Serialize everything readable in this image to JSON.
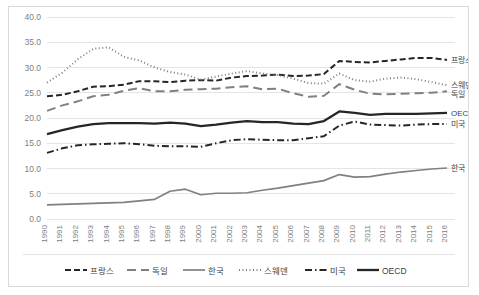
{
  "chart_data": {
    "type": "line",
    "title": "",
    "xlabel": "",
    "ylabel": "",
    "ylim": [
      0.0,
      40.0
    ],
    "yticks": [
      "0.0",
      "5.0",
      "10.0",
      "15.0",
      "20.0",
      "25.0",
      "30.0",
      "35.0",
      "40.0"
    ],
    "ytick_values": [
      0,
      5,
      10,
      15,
      20,
      25,
      30,
      35,
      40
    ],
    "grid": true,
    "legend_position": "bottom",
    "x": [
      1990,
      1991,
      1992,
      1993,
      1994,
      1995,
      1996,
      1997,
      1998,
      1999,
      2000,
      2001,
      2002,
      2003,
      2004,
      2005,
      2006,
      2007,
      2008,
      2009,
      2010,
      2011,
      2012,
      2013,
      2014,
      2015,
      2016
    ],
    "categories": [
      "1990",
      "1991",
      "1992",
      "1993",
      "1994",
      "1995",
      "1996",
      "1997",
      "1998",
      "1999",
      "2000",
      "2001",
      "2002",
      "2003",
      "2004",
      "2005",
      "2006",
      "2007",
      "2008",
      "2009",
      "2010",
      "2011",
      "2012",
      "2013",
      "2014",
      "2015",
      "2016"
    ],
    "series": [
      {
        "name": "프랑스",
        "style": "dashed",
        "color": "#262626",
        "width": 2.0,
        "dash": "6,3",
        "end_label": "프랑스",
        "values": [
          24.3,
          24.6,
          25.3,
          26.2,
          26.3,
          26.6,
          27.3,
          27.3,
          27.1,
          27.4,
          27.5,
          27.4,
          28.0,
          28.3,
          28.4,
          28.6,
          28.3,
          28.4,
          28.7,
          31.3,
          31.1,
          31.0,
          31.3,
          31.6,
          31.9,
          31.9,
          31.5
        ]
      },
      {
        "name": "독일",
        "style": "long-dashed",
        "color": "#808080",
        "width": 2.0,
        "dash": "9,5",
        "end_label": "독일",
        "values": [
          21.4,
          22.5,
          23.3,
          24.3,
          24.6,
          25.4,
          25.9,
          25.3,
          25.3,
          25.6,
          25.7,
          25.8,
          26.1,
          26.3,
          25.7,
          25.8,
          24.9,
          24.2,
          24.4,
          26.7,
          25.6,
          24.8,
          24.7,
          24.8,
          24.9,
          25.0,
          25.3
        ]
      },
      {
        "name": "한국",
        "style": "solid-thin",
        "color": "#808080",
        "width": 1.7,
        "dash": "",
        "end_label": "한국",
        "values": [
          2.8,
          2.9,
          3.0,
          3.1,
          3.2,
          3.3,
          3.6,
          3.9,
          5.5,
          5.9,
          4.8,
          5.1,
          5.1,
          5.2,
          5.7,
          6.1,
          6.6,
          7.1,
          7.6,
          8.8,
          8.3,
          8.4,
          8.9,
          9.3,
          9.6,
          9.9,
          10.1
        ]
      },
      {
        "name": "스웨덴",
        "style": "dotted",
        "color": "#808080",
        "width": 2.0,
        "dash": "1,2.5",
        "end_label": "스웨덴",
        "values": [
          27.0,
          29.0,
          31.6,
          33.7,
          34.0,
          32.1,
          31.4,
          30.0,
          29.1,
          28.6,
          27.6,
          28.2,
          28.8,
          29.3,
          28.8,
          28.5,
          27.8,
          26.9,
          26.8,
          28.8,
          27.5,
          27.2,
          27.8,
          28.0,
          27.7,
          27.1,
          26.5
        ]
      },
      {
        "name": "미국",
        "style": "dash-dot",
        "color": "#262626",
        "width": 2.0,
        "dash": "7,3,1.5,3",
        "end_label": "미국",
        "values": [
          13.1,
          14.0,
          14.6,
          14.8,
          14.9,
          15.0,
          14.8,
          14.5,
          14.4,
          14.4,
          14.3,
          15.0,
          15.6,
          15.8,
          15.7,
          15.6,
          15.6,
          16.0,
          16.4,
          18.5,
          19.3,
          18.7,
          18.6,
          18.5,
          18.7,
          18.8,
          18.8
        ]
      },
      {
        "name": "OECD",
        "style": "solid-thick",
        "color": "#262626",
        "width": 2.3,
        "dash": "",
        "end_label": "OECD",
        "values": [
          16.8,
          17.6,
          18.3,
          18.8,
          19.0,
          19.0,
          19.0,
          18.9,
          19.1,
          18.9,
          18.4,
          18.7,
          19.1,
          19.4,
          19.2,
          19.2,
          18.9,
          18.8,
          19.4,
          21.3,
          21.0,
          20.6,
          20.8,
          20.8,
          20.8,
          20.9,
          21.0
        ]
      }
    ],
    "legend": [
      {
        "label": "프랑스",
        "style": "dashed",
        "color": "#262626"
      },
      {
        "label": "독일",
        "style": "long-dashed",
        "color": "#808080"
      },
      {
        "label": "한국",
        "style": "solid-thin",
        "color": "#808080"
      },
      {
        "label": "스웨덴",
        "style": "dotted",
        "color": "#808080"
      },
      {
        "label": "미국",
        "style": "dash-dot",
        "color": "#262626"
      },
      {
        "label": "OECD",
        "style": "solid-thick",
        "color": "#262626"
      }
    ],
    "end_labels": [
      {
        "label": "프랑스",
        "value": 31.5
      },
      {
        "label": "스웨덴",
        "value": 26.5
      },
      {
        "label": "독일",
        "value": 25.3
      },
      {
        "label": "OECD",
        "value": 21.0
      },
      {
        "label": "미국",
        "value": 18.8
      },
      {
        "label": "한국",
        "value": 10.1
      }
    ],
    "colors": {
      "grid": "#e4e4e4",
      "axis_text": "#808080",
      "label_text": "#3f3f3f",
      "border": "#d9d9d9",
      "background": "#ffffff"
    }
  }
}
